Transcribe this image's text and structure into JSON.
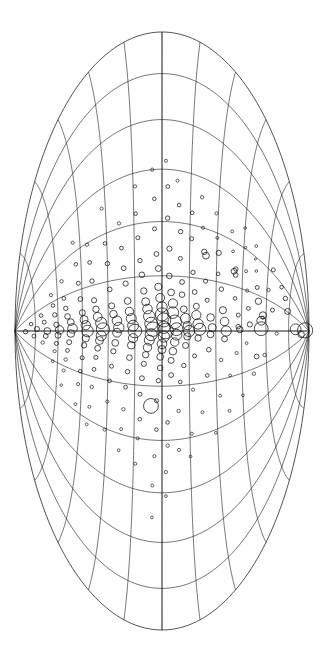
{
  "figure": {
    "name": "all-sky-source-map",
    "background_color": "#ffffff",
    "line_color": "#1a1a1a",
    "marker_color": "#111111",
    "width": 323,
    "height": 646,
    "orientation": "portrait"
  },
  "chart_data": {
    "type": "scatter",
    "title": "",
    "subtitle": "",
    "xlabel": "",
    "ylabel": "",
    "projection": "hammer-aitoff",
    "legend": null,
    "grid": true,
    "axis_ticks_visible": false,
    "tick_labels_visible": false,
    "xlim": [
      -180,
      180
    ],
    "ylim": [
      -90,
      90
    ],
    "graticule": {
      "meridian_step_deg": 30,
      "parallel_step_deg": 15,
      "labeled_meridians": [],
      "labeled_parallels": []
    },
    "marker_style": "open-circle",
    "size_encodes": "source-magnitude",
    "size_range_px": [
      1.0,
      11.0
    ],
    "n_points": 232,
    "points": [
      [
        5,
        87,
        7.6
      ],
      [
        -13,
        84,
        3.2
      ],
      [
        4,
        80,
        5.4
      ],
      [
        31,
        74,
        3.0
      ],
      [
        47,
        72,
        2.2
      ],
      [
        56,
        69,
        1.8
      ],
      [
        -3,
        67,
        1.6
      ],
      [
        22,
        64,
        2.0
      ],
      [
        64,
        63,
        2.0
      ],
      [
        40,
        61,
        1.7
      ],
      [
        -22,
        59,
        1.7
      ],
      [
        12,
        58,
        1.5
      ],
      [
        2,
        57,
        6.9
      ],
      [
        9,
        57,
        4.4
      ],
      [
        14,
        58,
        3.6
      ],
      [
        25,
        55,
        3.2
      ],
      [
        -21,
        54,
        2.4
      ],
      [
        36,
        54,
        2.0
      ],
      [
        49,
        53,
        1.3
      ],
      [
        58,
        52,
        1.1
      ],
      [
        69,
        52,
        1.4
      ],
      [
        -34,
        52,
        1.7
      ],
      [
        5,
        50,
        2.6
      ],
      [
        17,
        49,
        1.9
      ],
      [
        -9,
        48,
        1.4
      ],
      [
        30,
        48,
        1.6
      ],
      [
        44,
        47,
        1.5
      ],
      [
        61,
        46,
        1.2
      ],
      [
        75,
        45,
        1.3
      ],
      [
        -46,
        45,
        1.4
      ],
      [
        1,
        44,
        3.2
      ],
      [
        3,
        43,
        2.3
      ],
      [
        11,
        43,
        2.0
      ],
      [
        -15,
        42,
        1.6
      ],
      [
        22,
        41,
        1.8
      ],
      [
        38,
        41,
        2.4
      ],
      [
        40,
        40,
        2.9
      ],
      [
        42,
        41,
        2.2
      ],
      [
        53,
        39,
        1.4
      ],
      [
        66,
        38,
        1.5
      ],
      [
        -29,
        38,
        1.4
      ],
      [
        -52,
        37,
        1.5
      ],
      [
        0,
        36,
        5.1
      ],
      [
        6,
        35,
        4.3
      ],
      [
        -5,
        35,
        2.9
      ],
      [
        13,
        34,
        3.6
      ],
      [
        -18,
        33,
        1.7
      ],
      [
        26,
        33,
        2.2
      ],
      [
        -40,
        32,
        1.5
      ],
      [
        35,
        31,
        1.8
      ],
      [
        48,
        31,
        2.6
      ],
      [
        57,
        30,
        1.5
      ],
      [
        72,
        29,
        1.6
      ],
      [
        -62,
        29,
        1.4
      ],
      [
        2,
        28,
        4.0
      ],
      [
        -2,
        27,
        3.4
      ],
      [
        8,
        27,
        3.8
      ],
      [
        -11,
        26,
        2.3
      ],
      [
        18,
        25,
        2.0
      ],
      [
        -26,
        25,
        1.8
      ],
      [
        29,
        24,
        2.1
      ],
      [
        44,
        24,
        3.4
      ],
      [
        46,
        23,
        2.7
      ],
      [
        60,
        22,
        1.6
      ],
      [
        -47,
        22,
        1.5
      ],
      [
        78,
        21,
        1.7
      ],
      [
        1,
        21,
        6.0
      ],
      [
        4,
        20,
        5.2
      ],
      [
        -4,
        20,
        3.2
      ],
      [
        9,
        19,
        4.6
      ],
      [
        14,
        19,
        3.0
      ],
      [
        -14,
        18,
        2.0
      ],
      [
        22,
        18,
        2.4
      ],
      [
        -33,
        17,
        1.6
      ],
      [
        33,
        17,
        2.2
      ],
      [
        52,
        16,
        2.0
      ],
      [
        67,
        16,
        1.8
      ],
      [
        -58,
        16,
        1.5
      ],
      [
        -71,
        15,
        1.4
      ],
      [
        0,
        15,
        5.6
      ],
      [
        3,
        14,
        4.1
      ],
      [
        -3,
        14,
        3.6
      ],
      [
        7,
        13,
        5.0
      ],
      [
        -8,
        13,
        3.0
      ],
      [
        12,
        12,
        3.4
      ],
      [
        -19,
        12,
        2.2
      ],
      [
        20,
        11,
        2.8
      ],
      [
        27,
        11,
        2.4
      ],
      [
        -28,
        10,
        1.8
      ],
      [
        40,
        10,
        2.0
      ],
      [
        55,
        10,
        2.2
      ],
      [
        -44,
        9,
        1.7
      ],
      [
        70,
        9,
        1.8
      ],
      [
        -66,
        9,
        1.6
      ],
      [
        84,
        8,
        1.5
      ],
      [
        1,
        8,
        6.4
      ],
      [
        -2,
        8,
        5.4
      ],
      [
        5,
        7,
        6.8
      ],
      [
        -6,
        7,
        4.2
      ],
      [
        10,
        6,
        5.8
      ],
      [
        -11,
        6,
        3.8
      ],
      [
        15,
        6,
        4.6
      ],
      [
        -16,
        5,
        3.0
      ],
      [
        21,
        5,
        3.4
      ],
      [
        -24,
        5,
        2.4
      ],
      [
        30,
        4,
        2.8
      ],
      [
        -36,
        4,
        2.0
      ],
      [
        45,
        4,
        2.6
      ],
      [
        -50,
        3,
        1.8
      ],
      [
        62,
        3,
        2.2
      ],
      [
        -63,
        3,
        1.7
      ],
      [
        80,
        3,
        1.9
      ],
      [
        -78,
        2,
        1.6
      ],
      [
        95,
        2,
        1.5
      ],
      [
        -92,
        2,
        1.4
      ],
      [
        0,
        2,
        7.8
      ],
      [
        2,
        1,
        6.2
      ],
      [
        -3,
        1,
        5.6
      ],
      [
        6,
        1,
        7.0
      ],
      [
        -7,
        0,
        4.8
      ],
      [
        9,
        0,
        6.6
      ],
      [
        -10,
        0,
        4.0
      ],
      [
        13,
        0,
        5.2
      ],
      [
        -14,
        -1,
        3.4
      ],
      [
        18,
        -1,
        4.4
      ],
      [
        -20,
        -1,
        2.8
      ],
      [
        24,
        -2,
        3.6
      ],
      [
        -27,
        -2,
        2.2
      ],
      [
        34,
        -2,
        3.0
      ],
      [
        -38,
        -3,
        2.0
      ],
      [
        42,
        -3,
        2.4
      ],
      [
        -54,
        -3,
        1.8
      ],
      [
        56,
        -4,
        2.0
      ],
      [
        -69,
        -4,
        1.6
      ],
      [
        73,
        -4,
        1.8
      ],
      [
        -86,
        -5,
        1.5
      ],
      [
        90,
        -5,
        1.6
      ],
      [
        -105,
        -5,
        1.4
      ],
      [
        -41,
        -6,
        7.4
      ],
      [
        1,
        -5,
        7.2
      ],
      [
        -2,
        -6,
        6.0
      ],
      [
        4,
        -6,
        6.4
      ],
      [
        -5,
        -7,
        5.0
      ],
      [
        8,
        -7,
        5.8
      ],
      [
        -9,
        -8,
        4.2
      ],
      [
        12,
        -8,
        4.8
      ],
      [
        -13,
        -9,
        3.2
      ],
      [
        16,
        -9,
        4.0
      ],
      [
        -18,
        -10,
        2.6
      ],
      [
        22,
        -10,
        3.2
      ],
      [
        -26,
        -11,
        2.4
      ],
      [
        31,
        -11,
        2.8
      ],
      [
        -35,
        -12,
        2.0
      ],
      [
        39,
        -12,
        2.2
      ],
      [
        -49,
        -12,
        1.8
      ],
      [
        52,
        -13,
        2.0
      ],
      [
        -60,
        -13,
        1.6
      ],
      [
        66,
        -14,
        1.8
      ],
      [
        -75,
        -14,
        1.5
      ],
      [
        82,
        -14,
        1.7
      ],
      [
        0,
        -15,
        6.8
      ],
      [
        3,
        -16,
        5.4
      ],
      [
        -4,
        -16,
        4.6
      ],
      [
        7,
        -17,
        5.0
      ],
      [
        -8,
        -17,
        3.8
      ],
      [
        11,
        -18,
        4.2
      ],
      [
        -15,
        -18,
        2.8
      ],
      [
        17,
        -19,
        3.4
      ],
      [
        -23,
        -19,
        2.2
      ],
      [
        27,
        -20,
        2.6
      ],
      [
        -32,
        -20,
        1.9
      ],
      [
        36,
        -21,
        2.4
      ],
      [
        -45,
        -21,
        1.7
      ],
      [
        48,
        -22,
        1.9
      ],
      [
        -57,
        -22,
        1.5
      ],
      [
        63,
        -23,
        1.7
      ],
      [
        -70,
        -23,
        1.4
      ],
      [
        2,
        -24,
        5.2
      ],
      [
        -1,
        -25,
        4.4
      ],
      [
        6,
        -25,
        4.8
      ],
      [
        -7,
        -26,
        3.4
      ],
      [
        10,
        -27,
        3.8
      ],
      [
        -12,
        -27,
        2.6
      ],
      [
        15,
        -28,
        3.0
      ],
      [
        -21,
        -28,
        2.0
      ],
      [
        25,
        -29,
        2.4
      ],
      [
        -30,
        -29,
        1.8
      ],
      [
        41,
        -30,
        2.2
      ],
      [
        -43,
        -30,
        1.6
      ],
      [
        54,
        -31,
        1.8
      ],
      [
        -61,
        -31,
        1.5
      ],
      [
        77,
        -32,
        1.6
      ],
      [
        1,
        -33,
        6.6
      ],
      [
        -3,
        -34,
        5.0
      ],
      [
        5,
        -34,
        5.6
      ],
      [
        -6,
        -35,
        4.0
      ],
      [
        9,
        -36,
        4.4
      ],
      [
        -11,
        -36,
        2.9
      ],
      [
        14,
        -37,
        3.2
      ],
      [
        -17,
        -37,
        2.1
      ],
      [
        20,
        -38,
        2.6
      ],
      [
        -25,
        -38,
        1.9
      ],
      [
        33,
        -39,
        2.2
      ],
      [
        -37,
        -39,
        1.7
      ],
      [
        46,
        -40,
        1.9
      ],
      [
        -51,
        -40,
        1.5
      ],
      [
        59,
        -41,
        1.7
      ],
      [
        -64,
        -41,
        1.4
      ],
      [
        0,
        -42,
        5.8
      ],
      [
        4,
        -43,
        4.6
      ],
      [
        -5,
        -43,
        3.6
      ],
      [
        8,
        -44,
        4.0
      ],
      [
        -10,
        -44,
        2.7
      ],
      [
        13,
        -45,
        3.0
      ],
      [
        -19,
        -45,
        2.0
      ],
      [
        23,
        -46,
        2.4
      ],
      [
        -29,
        -46,
        1.8
      ],
      [
        35,
        -47,
        2.0
      ],
      [
        -39,
        -47,
        1.6
      ],
      [
        50,
        -48,
        1.8
      ],
      [
        -55,
        -48,
        1.4
      ],
      [
        68,
        -49,
        1.6
      ],
      [
        2,
        -51,
        4.8
      ],
      [
        -2,
        -52,
        3.8
      ],
      [
        7,
        -52,
        3.4
      ],
      [
        -9,
        -53,
        2.5
      ],
      [
        12,
        -54,
        2.8
      ],
      [
        -16,
        -54,
        1.9
      ],
      [
        19,
        -55,
        2.2
      ],
      [
        -24,
        -55,
        1.7
      ],
      [
        28,
        -56,
        1.9
      ],
      [
        -34,
        -56,
        1.5
      ],
      [
        44,
        -57,
        1.7
      ],
      [
        -48,
        -57,
        1.3
      ],
      [
        1,
        -59,
        4.2
      ],
      [
        -4,
        -60,
        3.0
      ],
      [
        6,
        -61,
        2.6
      ],
      [
        -12,
        -61,
        2.0
      ],
      [
        16,
        -62,
        2.2
      ],
      [
        -20,
        -62,
        1.6
      ],
      [
        26,
        -63,
        1.8
      ],
      [
        -31,
        -63,
        1.4
      ],
      [
        38,
        -64,
        1.6
      ],
      [
        0,
        -67,
        3.4
      ],
      [
        -6,
        -68,
        2.4
      ],
      [
        11,
        -69,
        2.0
      ],
      [
        -15,
        -70,
        1.7
      ],
      [
        21,
        -71,
        1.8
      ],
      [
        3,
        -74,
        2.6
      ],
      [
        -9,
        -76,
        2.0
      ],
      [
        14,
        -78,
        1.8
      ],
      [
        -2,
        -82,
        2.2
      ]
    ]
  }
}
